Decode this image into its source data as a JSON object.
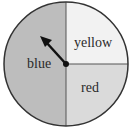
{
  "diagram": {
    "type": "spinner",
    "center": [
      66,
      64
    ],
    "radius": 62,
    "sections": [
      {
        "label": "blue",
        "fraction": 0.5,
        "fill": "#bdbdbd"
      },
      {
        "label": "yellow",
        "fraction": 0.25,
        "fill": "#f2f2f2"
      },
      {
        "label": "red",
        "fraction": 0.25,
        "fill": "#dadada"
      }
    ],
    "arrow": {
      "points_to": "blue",
      "angle_deg": 135
    }
  },
  "labels": {
    "blue": "blue",
    "yellow": "yellow",
    "red": "red"
  }
}
